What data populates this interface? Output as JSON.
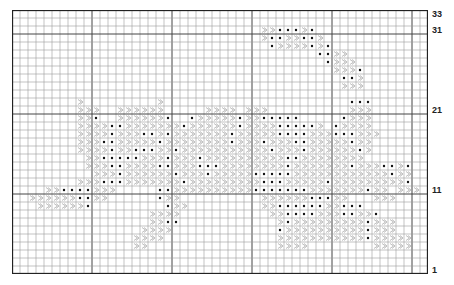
{
  "chart_title": "",
  "grid": {
    "columns": 52,
    "rows": 33,
    "cell_px": 8,
    "major_every": 10,
    "line_color": "#9a9a9a",
    "major_color": "#444444",
    "border_color": "#222222"
  },
  "symbols": {
    "x": "chevron (light gray)",
    "o": "dot (black)"
  },
  "row_labels": [
    {
      "label": "33",
      "row": 33
    },
    {
      "label": "31",
      "row": 31
    },
    {
      "label": "21",
      "row": 21
    },
    {
      "label": "11",
      "row": 11
    },
    {
      "label": "1",
      "row": 1
    }
  ],
  "pattern": [
    "....................................................",
    "....................................................",
    "...............................xxoooxo..............",
    "...............................xooxxoox.............",
    "................................oxxxxoxo............",
    "......................................ooxx..........",
    ".......................................oxxx.........",
    "........................................xxxo........",
    ".........................................oox........",
    ".........................................xxx........",
    "....................................................",
    "........x.........x.......................ooo.......",
    "........xxx..xxxxxx.....xxxx.xxx..........xxx.......",
    "........xxo..xxxxxxo..oxxxxxoxxooooo.....oxxx.......",
    "........xxxxooxxxxxxxoxxxxxxoxxxxooooox.oxxxx.......",
    "........xxxxoxxxooxoxxxxxxxoxxxxxooooxxxoooxxx......",
    "........xxxooxxxxxoxxxxxxxxoxxxoxxxooxxxxxoxx.......",
    "........xxxxoxxoooxxoxxxxxxxxxxxoxxxoxxxxxxox.......",
    ".........xxoooooxxxoxxxoxxxxxxxxxxooxxxxxxxx........",
    ".........xxxooxxxxooxxxoooxxxxxxxxoxxxxxxxoxxxooxo...",
    "..........xxxoxxxxxxoxxxoxxxxxoooooxxxxxxxxxxxxoxx...",
    "........xxxoooxxxxxxxoxxxxxxxxxoooxxxxxoxxxxxxxxxo...",
    "....xxooooxxx.....ooxxxxxxxxxxoooooooxxxxxxxoxx.xxx..",
    "..xxxxxxooxx......oxx..........xxxxxxoooxx...xxx.....",
    "...xxxxxxo.........oxx.........xxooooooxxooo.........",
    ".................xxxx...........xxooooxxxooxxo.......",
    ".................xxoo............xoxxxxxxxxxoxxx.....",
    "................xxxx.............oxxxxxxxxxxoxxx.....",
    "...............xxxx..............xxxxxxxxxxxoxxxxx...",
    "...............xx................xxxx........xxxxx...",
    "....................................................",
    "....................................................",
    "...................................................."
  ]
}
